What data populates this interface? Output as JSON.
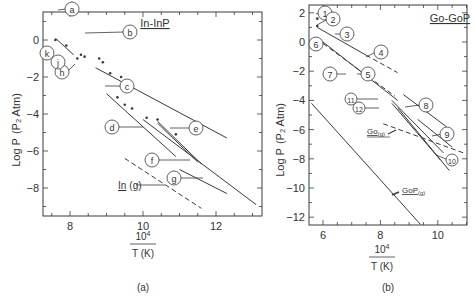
{
  "chart_data": [
    {
      "id": "a",
      "type": "line",
      "panel_label": "(a)",
      "title": "In-InP",
      "xlabel_num": "10",
      "xlabel_exp": "4",
      "xlabel_den": "T (K)",
      "ylabel": "Log P",
      "ylabel_unit": "(P2 Atm)",
      "xlim": [
        7.3,
        13.3
      ],
      "ylim": [
        -9.5,
        1.3
      ],
      "x_ticks": [
        8,
        10,
        12
      ],
      "y_ticks": [
        0,
        -2,
        -4,
        -6,
        -8
      ],
      "grid": false,
      "series": [
        {
          "name": "a",
          "style": "solid",
          "points": [
            [
              7.6,
              0.1
            ],
            [
              8.1,
              -0.8
            ]
          ]
        },
        {
          "name": "c",
          "style": "solid",
          "points": [
            [
              8.7,
              -1.5
            ],
            [
              12.3,
              -5.3
            ]
          ]
        },
        {
          "name": "d",
          "style": "solid",
          "points": [
            [
              9.0,
              -2.9
            ],
            [
              10.9,
              -6.3
            ]
          ]
        },
        {
          "name": "e",
          "style": "solid",
          "points": [
            [
              10.4,
              -4.5
            ],
            [
              11.5,
              -6.6
            ]
          ]
        },
        {
          "name": "e2",
          "style": "solid",
          "points": [
            [
              10.4,
              -4.4
            ],
            [
              11.6,
              -6.7
            ]
          ]
        },
        {
          "name": "f",
          "style": "solid",
          "points": [
            [
              10.0,
              -4.3
            ],
            [
              13.1,
              -8.9
            ]
          ]
        },
        {
          "name": "g",
          "style": "solid",
          "points": [
            [
              11.0,
              -7.0
            ],
            [
              12.3,
              -8.3
            ]
          ]
        },
        {
          "name": "In (g)",
          "style": "dashed",
          "points": [
            [
              9.5,
              -6.4
            ],
            [
              11.6,
              -9.1
            ]
          ]
        }
      ],
      "scatter_points": [
        [
          7.6,
          0.0
        ],
        [
          7.9,
          -0.3
        ],
        [
          8.2,
          -1.0
        ],
        [
          8.3,
          -0.8
        ],
        [
          8.4,
          -0.9
        ],
        [
          8.8,
          -1.0
        ],
        [
          8.9,
          -1.2
        ],
        [
          9.1,
          -1.8
        ],
        [
          9.4,
          -2.0
        ],
        [
          9.3,
          -3.1
        ],
        [
          9.5,
          -3.5
        ],
        [
          9.7,
          -3.7
        ],
        [
          10.1,
          -4.2
        ],
        [
          10.4,
          -4.3
        ],
        [
          10.9,
          -5.1
        ]
      ],
      "annotations": [
        "a",
        "b",
        "c",
        "d",
        "e",
        "f",
        "g",
        "h",
        "j",
        "k",
        "In (g)"
      ]
    },
    {
      "id": "b",
      "type": "line",
      "panel_label": "(b)",
      "title": "Go-GoP",
      "xlabel_num": "10",
      "xlabel_exp": "4",
      "xlabel_den": "T (K)",
      "ylabel": "Log P",
      "ylabel_unit": "(P2 Atm)",
      "xlim": [
        5.5,
        11.0
      ],
      "ylim": [
        -12.5,
        2.5
      ],
      "x_ticks": [
        6,
        8,
        10
      ],
      "y_ticks": [
        2,
        0,
        -2,
        -4,
        -6,
        -8,
        -10,
        -12
      ],
      "grid": false,
      "series": [
        {
          "name": "3",
          "style": "solid",
          "points": [
            [
              5.8,
              1.0
            ],
            [
              7.5,
              -0.9
            ]
          ]
        },
        {
          "name": "4",
          "style": "dashed",
          "points": [
            [
              7.5,
              -0.9
            ],
            [
              8.6,
              -2.1
            ]
          ]
        },
        {
          "name": "5",
          "style": "solid",
          "points": [
            [
              6.0,
              0.0
            ],
            [
              8.6,
              -4.0
            ]
          ]
        },
        {
          "name": "7",
          "style": "dashed",
          "points": [
            [
              6.0,
              -0.1
            ],
            [
              8.5,
              -3.7
            ]
          ]
        },
        {
          "name": "8",
          "style": "solid",
          "points": [
            [
              8.8,
              -3.6
            ],
            [
              10.3,
              -5.8
            ]
          ]
        },
        {
          "name": "9",
          "style": "solid",
          "points": [
            [
              9.3,
              -5.3
            ],
            [
              10.5,
              -7.2
            ]
          ]
        },
        {
          "name": "11",
          "style": "solid",
          "points": [
            [
              8.4,
              -4.0
            ],
            [
              10.2,
              -7.6
            ]
          ]
        },
        {
          "name": "12",
          "style": "solid",
          "points": [
            [
              8.4,
              -4.2
            ],
            [
              10.1,
              -8.1
            ]
          ]
        },
        {
          "name": "10",
          "style": "solid",
          "points": [
            [
              8.6,
              -4.5
            ],
            [
              10.4,
              -8.8
            ]
          ]
        },
        {
          "name": "Go (g)",
          "style": "dashed",
          "points": [
            [
              8.1,
              -5.6
            ],
            [
              10.9,
              -7.6
            ]
          ]
        },
        {
          "name": "GoP (g)",
          "style": "solid",
          "points": [
            [
              5.6,
              -4.2
            ],
            [
              9.4,
              -12.5
            ]
          ]
        }
      ],
      "scatter_points": [
        [
          5.8,
          1.6
        ],
        [
          5.8,
          1.1
        ]
      ],
      "annotations": [
        "1",
        "2",
        "3",
        "4",
        "5",
        "6",
        "7",
        "8",
        "9",
        "10",
        "11",
        "12",
        "Go (g)",
        "GoP (g)"
      ]
    }
  ]
}
